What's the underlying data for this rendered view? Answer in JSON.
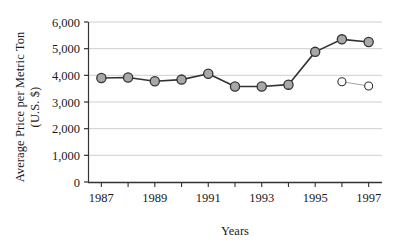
{
  "chart_data": {
    "type": "line",
    "title": "",
    "xlabel": "Years",
    "ylabel": "Average Price per Metric Ton (U.S. $)",
    "ylabel_line1": "Average Price per Metric Ton",
    "ylabel_line2": "(U.S. $)",
    "x": [
      1987,
      1988,
      1989,
      1990,
      1991,
      1992,
      1993,
      1994,
      1995,
      1996,
      1997
    ],
    "xtick_labels": [
      "1987",
      "1989",
      "1991",
      "1993",
      "1995",
      "1997"
    ],
    "xtick_values": [
      1987,
      1989,
      1991,
      1993,
      1995,
      1997
    ],
    "xlim": [
      1986.5,
      1997.5
    ],
    "ytick_labels": [
      "0",
      "1,000",
      "2,000",
      "3,000",
      "4,000",
      "5,000",
      "6,000"
    ],
    "ytick_values": [
      0,
      1000,
      2000,
      3000,
      4000,
      5000,
      6000
    ],
    "ylim": [
      0,
      6000
    ],
    "grid": "horizontal",
    "legend": "none",
    "series": [
      {
        "name": "filled-marker-series",
        "marker": "filled-circle",
        "marker_fill": "#a8a8a8",
        "marker_edge": "#333333",
        "line_color": "#333333",
        "x": [
          1987,
          1988,
          1989,
          1990,
          1991,
          1992,
          1993,
          1994,
          1995,
          1996,
          1997
        ],
        "values": [
          3900,
          3920,
          3780,
          3840,
          4060,
          3580,
          3580,
          3650,
          4880,
          5350,
          5250
        ]
      },
      {
        "name": "open-marker-series",
        "marker": "open-circle",
        "marker_fill": "#ffffff",
        "marker_edge": "#333333",
        "line_color": "#9a9a9a",
        "x": [
          1996,
          1997
        ],
        "values": [
          3760,
          3600
        ]
      }
    ],
    "colors": {
      "axis": "#333333",
      "gridline": "#cfcfcf",
      "text": "#1a1a1a",
      "marker_fill": "#a8a8a8",
      "marker_edge": "#333333"
    }
  }
}
